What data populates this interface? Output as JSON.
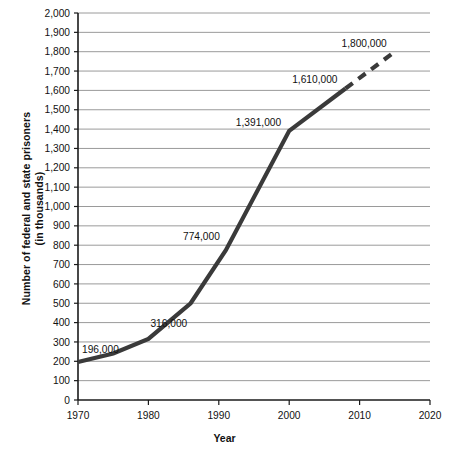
{
  "chart_data": {
    "type": "line",
    "title": "",
    "xlabel": "Year",
    "ylabel": "Number of federal and state prisoners (in thousands)",
    "ylabel_line1": "Number of federal and state prisoners",
    "ylabel_line2": "(in thousands)",
    "xlim": [
      1970,
      2020
    ],
    "ylim": [
      0,
      2000
    ],
    "grid": true,
    "legend": false,
    "x_ticks": [
      1970,
      1980,
      1990,
      2000,
      2010,
      2020
    ],
    "x_tick_labels": [
      "1970",
      "1980",
      "1990",
      "2000",
      "2010",
      "2020"
    ],
    "y_ticks": [
      0,
      100,
      200,
      300,
      400,
      500,
      600,
      700,
      800,
      900,
      1000,
      1100,
      1200,
      1300,
      1400,
      1500,
      1600,
      1700,
      1800,
      1900,
      2000
    ],
    "y_tick_labels": [
      "0",
      "100",
      "200",
      "300",
      "400",
      "500",
      "600",
      "700",
      "800",
      "900",
      "1,000",
      "1,100",
      "1,200",
      "1,300",
      "1,400",
      "1,500",
      "1,600",
      "1,700",
      "1,800",
      "1,900",
      "2,000"
    ],
    "series": [
      {
        "name": "Actual",
        "style": "solid",
        "color": "#3a3a3a",
        "x": [
          1970,
          1975,
          1980,
          1986,
          1991,
          2000,
          2008
        ],
        "y": [
          196,
          240,
          316,
          500,
          774,
          1391,
          1610
        ]
      },
      {
        "name": "Projected",
        "style": "dashed",
        "color": "#3a3a3a",
        "x": [
          2008,
          2015
        ],
        "y": [
          1610,
          1800
        ]
      }
    ],
    "annotations": [
      {
        "label": "196,000",
        "x": 1970,
        "y": 196
      },
      {
        "label": "316,000",
        "x": 1980,
        "y": 316
      },
      {
        "label": "774,000",
        "x": 1991,
        "y": 774
      },
      {
        "label": "1,391,000",
        "x": 2000,
        "y": 1391
      },
      {
        "label": "1,610,000",
        "x": 2008,
        "y": 1610
      },
      {
        "label": "1,800,000",
        "x": 2015,
        "y": 1800
      }
    ],
    "colors": {
      "line": "#3a3a3a",
      "grid": "#9a9a9a",
      "axis": "#1a1a1a",
      "text": "#111111",
      "background": "#ffffff"
    }
  }
}
